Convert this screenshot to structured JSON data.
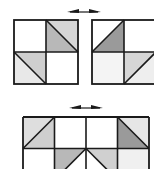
{
  "diagram": {
    "colors": {
      "stroke": "#1a1a1a",
      "dark_shade": "#9a9a9a",
      "mid_shade": "#b8b8b8",
      "light_shade": "#d6d6d6",
      "faint_shade": "#ececec",
      "white": "#ffffff"
    },
    "top_arrow": {
      "icon": "double-headed-arrow-icon",
      "direction": "left-right"
    },
    "bottom_arrow": {
      "icon": "double-headed-arrow-icon",
      "direction": "left-right"
    },
    "top_left_square": {
      "grid": "2x2",
      "cells": [
        {
          "pos": "top-left",
          "fill": "white"
        },
        {
          "pos": "top-right",
          "diagonal": "tl-br",
          "shaded_half": "lower-left",
          "shade": "mid"
        },
        {
          "pos": "bottom-left",
          "diagonal": "tl-br",
          "shaded_half": "upper-right",
          "shade": "light"
        },
        {
          "pos": "bottom-right",
          "fill": "white"
        }
      ]
    },
    "top_right_square": {
      "grid": "2x2",
      "cells": [
        {
          "pos": "top-left",
          "diagonal": "tr-bl",
          "shaded_half": "lower-right",
          "shade": "dark"
        },
        {
          "pos": "top-right",
          "fill": "white"
        },
        {
          "pos": "bottom-left",
          "fill": "white"
        },
        {
          "pos": "bottom-right",
          "diagonal": "tr-bl",
          "shaded_half": "upper-left",
          "shade": "light"
        }
      ]
    },
    "bottom_strip": {
      "grid": "4xN (partially visible)",
      "row1": [
        {
          "col": 1,
          "diagonal": "tr-bl",
          "shaded_half": "lower-right",
          "shade": "light"
        },
        {
          "col": 2,
          "fill": "white"
        },
        {
          "col": 3,
          "fill": "white"
        },
        {
          "col": 4,
          "diagonal": "tl-br",
          "shaded_half": "lower-left",
          "shade": "dark"
        }
      ],
      "row2": [
        {
          "col": 1,
          "fill": "white"
        },
        {
          "col": 2,
          "diagonal": "tr-bl",
          "shaded_half": "upper-left",
          "shade": "mid"
        },
        {
          "col": 3,
          "diagonal": "tl-br",
          "shaded_half": "upper-right",
          "shade": "light"
        },
        {
          "col": 4,
          "fill": "faint"
        }
      ]
    }
  }
}
